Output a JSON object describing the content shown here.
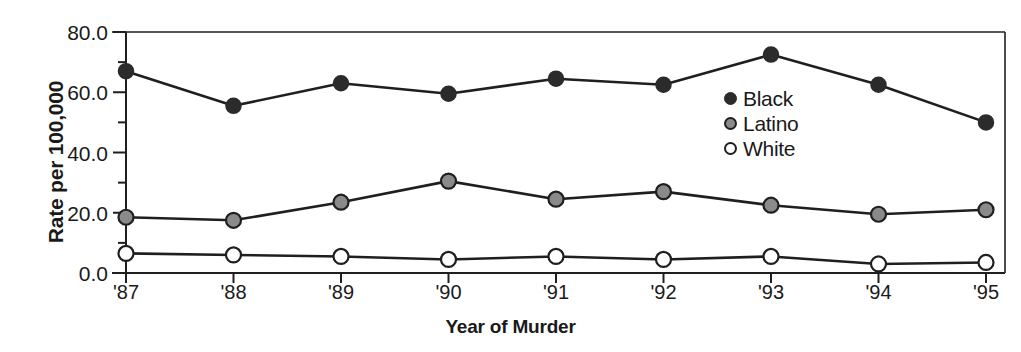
{
  "chart_data": {
    "type": "line",
    "title": "",
    "xlabel": "Year of Murder",
    "ylabel": "Rate per 100,000",
    "categories": [
      "'87",
      "'88",
      "'89",
      "'90",
      "'91",
      "'92",
      "'93",
      "'94",
      "'95"
    ],
    "ylim": [
      0.0,
      80.0
    ],
    "ytick_labels": [
      "0.0",
      "20.0",
      "40.0",
      "60.0",
      "80.0"
    ],
    "ytick_values": [
      0.0,
      20.0,
      40.0,
      60.0,
      80.0
    ],
    "yminor_values": [
      10.0,
      30.0,
      50.0,
      70.0
    ],
    "grid": false,
    "legend_position": "center-right-inside",
    "series": [
      {
        "name": "Black",
        "marker": "filled-circle",
        "color": "#2b2b2b",
        "values": [
          67.0,
          55.5,
          63.0,
          59.5,
          64.5,
          62.5,
          72.5,
          62.5,
          50.0
        ]
      },
      {
        "name": "Latino",
        "marker": "gray-circle",
        "color": "#8a8a8a",
        "values": [
          18.5,
          17.5,
          23.5,
          30.5,
          24.5,
          27.0,
          22.5,
          19.5,
          21.0
        ]
      },
      {
        "name": "White",
        "marker": "open-circle",
        "color": "#ffffff",
        "values": [
          6.5,
          6.0,
          5.5,
          4.5,
          5.5,
          4.5,
          5.5,
          3.0,
          3.5
        ]
      }
    ],
    "line_color": "#1f1f1f",
    "axis_color": "#1f1f1f"
  }
}
